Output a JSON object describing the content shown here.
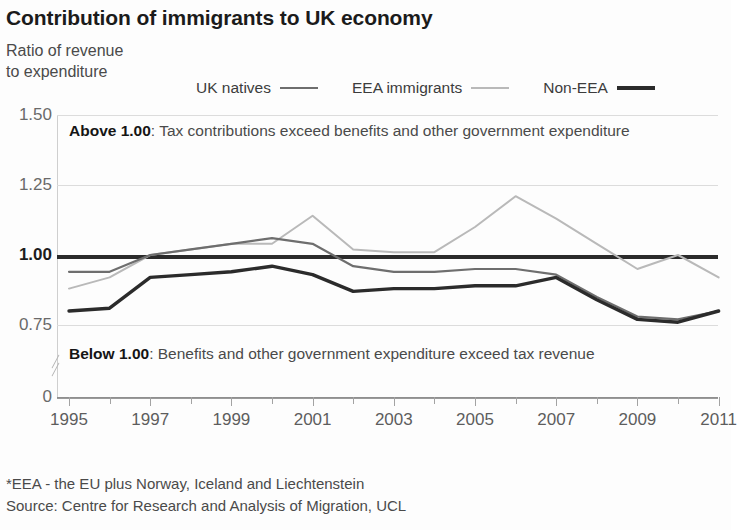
{
  "title": "Contribution of immigrants to UK economy",
  "axis_caption": "Ratio of revenue\nto expenditure",
  "legend": {
    "items": [
      {
        "label": "UK natives",
        "color": "#6e6e6e",
        "swatch": "sw-natives"
      },
      {
        "label": "EEA immigrants",
        "color": "#b9b9b9",
        "swatch": "sw-eea"
      },
      {
        "label": "Non-EEA",
        "color": "#2b2b2b",
        "swatch": "sw-noneea"
      }
    ]
  },
  "annotations": {
    "above_bold": "Above 1.00",
    "above_text": ": Tax contributions exceed benefits and other government expenditure",
    "below_bold": "Below 1.00",
    "below_text": ": Benefits and other government expenditure exceed tax revenue"
  },
  "footer": "*EEA - the EU plus Norway, Iceland and Liechtenstein\nSource: Centre for Research and Analysis of Migration, UCL",
  "chart_data": {
    "type": "line",
    "title": "Contribution of immigrants to UK economy",
    "xlabel": "",
    "ylabel": "Ratio of revenue to expenditure",
    "ylim": [
      0.625,
      1.5
    ],
    "yticks": [
      "0",
      "0.75",
      "1.00",
      "1.25",
      "1.50"
    ],
    "ytick_values": [
      0,
      0.75,
      1.0,
      1.25,
      1.5
    ],
    "grid": true,
    "legend_position": "top",
    "reference_line": 1.0,
    "x": [
      1995,
      1996,
      1997,
      1998,
      1999,
      2000,
      2001,
      2002,
      2003,
      2004,
      2005,
      2006,
      2007,
      2008,
      2009,
      2010,
      2011
    ],
    "xtick_labels": [
      "1995",
      "1997",
      "1999",
      "2001",
      "2003",
      "2005",
      "2007",
      "2009",
      "2011"
    ],
    "series": [
      {
        "name": "UK natives",
        "color": "#6e6e6e",
        "values": [
          0.94,
          0.94,
          1.0,
          1.02,
          1.04,
          1.06,
          1.04,
          0.96,
          0.94,
          0.94,
          0.95,
          0.95,
          0.93,
          0.85,
          0.78,
          0.77,
          0.8
        ]
      },
      {
        "name": "EEA immigrants",
        "color": "#b9b9b9",
        "values": [
          0.88,
          0.92,
          1.0,
          1.02,
          1.04,
          1.04,
          1.14,
          1.02,
          1.01,
          1.01,
          1.1,
          1.21,
          1.13,
          1.04,
          0.95,
          1.0,
          0.92
        ]
      },
      {
        "name": "Non-EEA",
        "color": "#2b2b2b",
        "values": [
          0.8,
          0.81,
          0.92,
          0.93,
          0.94,
          0.96,
          0.93,
          0.87,
          0.88,
          0.88,
          0.89,
          0.89,
          0.92,
          0.84,
          0.77,
          0.76,
          0.8
        ]
      }
    ]
  }
}
